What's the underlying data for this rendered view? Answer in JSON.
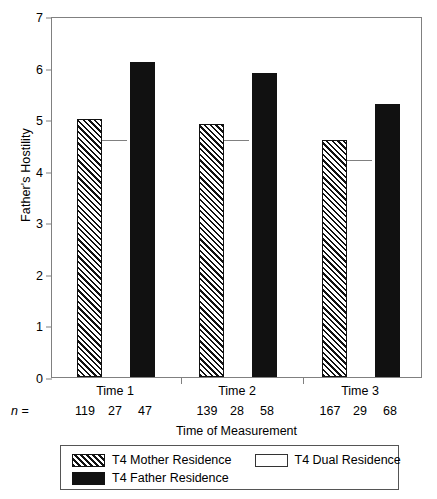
{
  "chart_data": {
    "type": "bar",
    "title": "",
    "xlabel": "Time of Measurement",
    "ylabel": "Father's Hostility",
    "categories": [
      "Time 1",
      "Time 2",
      "Time 3"
    ],
    "ylim": [
      0,
      7
    ],
    "yticks": [
      0,
      1,
      2,
      3,
      4,
      5,
      6,
      7
    ],
    "ytick_labels": [
      "0",
      "1",
      "2",
      "3",
      "4",
      "5",
      "6",
      "7"
    ],
    "grid": false,
    "legend_position": "bottom",
    "series": [
      {
        "name": "T4 Mother Residence",
        "style": "diagonal-hatch",
        "values": [
          5.0,
          4.9,
          4.6
        ]
      },
      {
        "name": "T4 Dual Residence",
        "style": "white-open",
        "values": [
          4.6,
          4.6,
          4.2
        ]
      },
      {
        "name": "T4 Father Residence",
        "style": "solid-black",
        "values": [
          6.1,
          5.9,
          5.3
        ]
      }
    ],
    "n_label": "n =",
    "n_counts": [
      [
        "119",
        "27",
        "47"
      ],
      [
        "139",
        "28",
        "58"
      ],
      [
        "167",
        "29",
        "68"
      ]
    ],
    "colors": {
      "hatch": "#111111",
      "solid": "#111111",
      "open": "#ffffff",
      "axis": "#808080",
      "text": "#000000"
    }
  },
  "legend": {
    "items": [
      {
        "label": "T4 Mother Residence",
        "swatch": "diagonal-hatch"
      },
      {
        "label": "T4 Dual Residence",
        "swatch": "white-open"
      },
      {
        "label": "T4 Father Residence",
        "swatch": "solid-black"
      }
    ]
  }
}
